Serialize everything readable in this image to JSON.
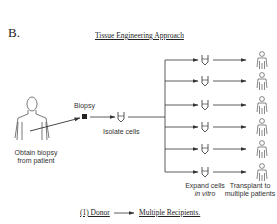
{
  "figure": {
    "panel_letter": "B.",
    "title": "Tissue Engineering Approach",
    "steps": {
      "obtain": "Obtain biopsy\nfrom patient",
      "obtain_line1": "Obtain biopsy",
      "obtain_line2": "from patient",
      "biopsy": "Biopsy",
      "isolate": "Isolate cells",
      "expand_line1": "Expand cells",
      "expand_line2": "in vitro",
      "transplant_line1": "Transplant to",
      "transplant_line2": "multiple patients"
    },
    "footer": {
      "left": "(1) Donor",
      "right": "Multiple Recipients."
    },
    "branch_count": 6,
    "branch_rows_y": [
      60,
      81,
      105,
      127,
      149,
      172
    ],
    "colors": {
      "line": "#333333",
      "text": "#222222"
    }
  }
}
